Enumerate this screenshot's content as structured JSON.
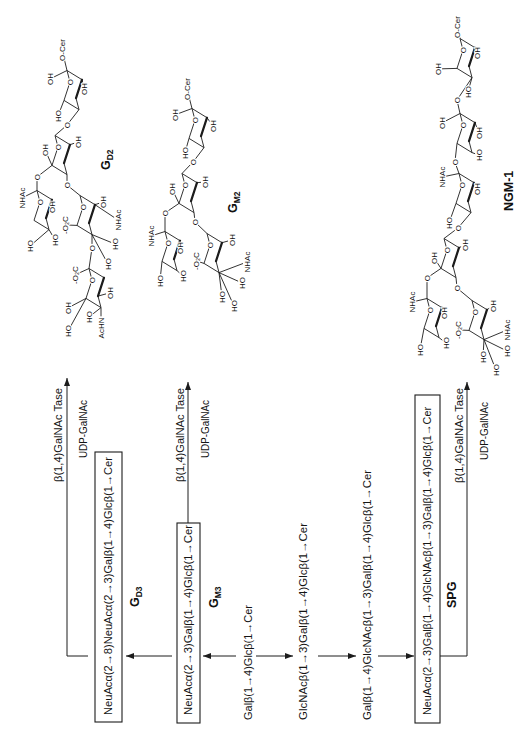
{
  "figure": {
    "pathway": {
      "gd3": {
        "sequence": "NeuAcα(2→8)NeuAcα(2→3)Galβ(1→4)Glcβ(1→Cer",
        "name": "G",
        "name_sub": "D3"
      },
      "gm3": {
        "sequence": "NeuAcα(2→3)Galβ(1→4)Glcβ(1→Cer",
        "name": "G",
        "name_sub": "M3"
      },
      "lac_cer": {
        "sequence": "Galβ(1→4)Glcβ(1→Cer"
      },
      "lc3_cer": {
        "sequence": "GlcNAcβ(1→3)Galβ(1→4)Glcβ(1→Cer"
      },
      "nlc4_cer": {
        "sequence": "Galβ(1→4)GlcNAcβ(1→3)Galβ(1→4)Glcβ(1→Cer"
      },
      "spg": {
        "sequence": "NeuAcα(2→3)Galβ(1→4)GlcNAcβ(1→3)Galβ(1→4)Glcβ(1→Cer",
        "name": "SPG"
      },
      "reactions": [
        {
          "enzyme": "β(1,4)GalNAc Tase",
          "donor": "UDP-GalNAc"
        },
        {
          "enzyme": "β(1,4)GalNAc Tase",
          "donor": "UDP-GalNAc"
        },
        {
          "enzyme": "β(1,4)GalNAc Tase",
          "donor": "UDP-GalNAc"
        }
      ]
    },
    "structures": {
      "gd2": {
        "name": "G",
        "name_sub": "D2",
        "atoms": [
          "O-Cer",
          "O",
          "OH",
          "OH",
          "HO",
          "O",
          "OH",
          "O",
          "OH",
          "O",
          "O",
          "NHAc",
          "O",
          "OH",
          "HO",
          "HO",
          "-O₂C",
          "O",
          "OH",
          "NHAc",
          "HO",
          "HO",
          "O",
          "-O₂C",
          "O",
          "OH",
          "HO",
          "AcHN",
          "OH",
          "HO"
        ]
      },
      "gm2": {
        "name": "G",
        "name_sub": "M2",
        "atoms": [
          "O-Cer",
          "O",
          "OH",
          "OH",
          "HO",
          "O",
          "OH",
          "O",
          "OH",
          "O",
          "O",
          "NHAc",
          "O",
          "OH",
          "HO",
          "HO",
          "-O₂C",
          "O",
          "OH",
          "NHAc",
          "HO",
          "HO",
          "HO"
        ]
      },
      "ngm1": {
        "name": "NGM-1",
        "atoms": [
          "O-Cer",
          "O",
          "OH",
          "OH",
          "HO",
          "O",
          "O",
          "OH",
          "OH",
          "HO",
          "O",
          "NHAc",
          "O",
          "OH",
          "HO",
          "O",
          "O",
          "OH",
          "OH",
          "O",
          "O",
          "NHAc",
          "O",
          "OH",
          "HO",
          "HO",
          "-O₂C",
          "O",
          "OH",
          "NHAc",
          "HO",
          "HO",
          "HO"
        ]
      }
    }
  }
}
